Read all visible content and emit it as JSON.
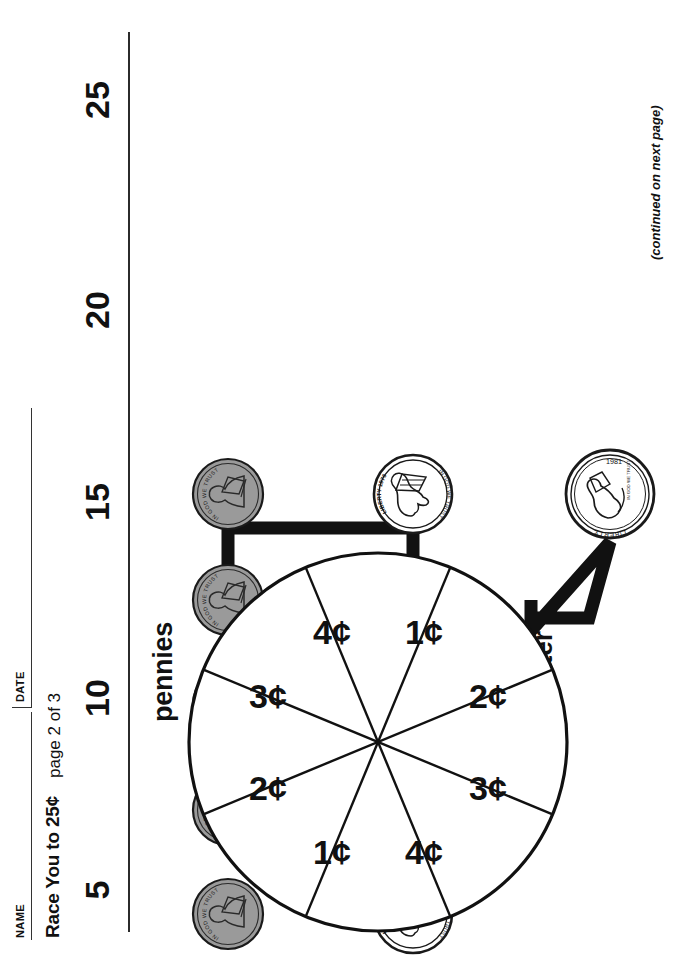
{
  "header": {
    "name_label": "NAME",
    "date_label": "DATE",
    "title": "Race You to 25¢",
    "page_note": "page 2 of 3"
  },
  "footer": {
    "note": "(continued on next page)"
  },
  "number_track": {
    "values": [
      "5",
      "10",
      "15",
      "20",
      "25"
    ],
    "x_positions": [
      40,
      232,
      428,
      620,
      830
    ]
  },
  "sections": {
    "pennies_label": "pennies",
    "nickels_label": "nickels",
    "quarter_label": "quarter"
  },
  "coins": {
    "pennies": {
      "count": 5,
      "denomination": "1¢",
      "inscriptions": [
        "IN GOD WE TRUST",
        "LIBERTY",
        "1976"
      ],
      "fill": "#9a9a9a",
      "stroke": "#1a1a1a",
      "radius": 35,
      "row_y": 58,
      "x_positions": [
        46,
        150,
        256,
        360,
        466
      ]
    },
    "nickels": {
      "count": 5,
      "denomination": "5¢",
      "inscriptions": [
        "LIBERTY 1976",
        "IN GOD WE TRUST"
      ],
      "fill": "#ffffff",
      "stroke": "#1a1a1a",
      "radius": 39,
      "row_y": 243,
      "x_positions": [
        46,
        150,
        256,
        360,
        466
      ]
    },
    "quarter": {
      "count": 1,
      "denomination": "25¢",
      "inscriptions": [
        "LIBERTY",
        "IN GOD WE TRUST",
        "1981"
      ],
      "fill": "#ffffff",
      "stroke": "#1a1a1a",
      "radius": 44,
      "center_x": 466,
      "center_y": 440
    }
  },
  "arrow": {
    "description": "thick bracket arrows joining pennies to nickels to quarter",
    "color": "#111111",
    "thickness": 13
  },
  "chart_data": {
    "type": "pie",
    "categories": [
      "3¢",
      "4¢",
      "1¢",
      "2¢",
      "3¢",
      "4¢",
      "1¢",
      "2¢"
    ],
    "values": [
      1,
      1,
      1,
      1,
      1,
      1,
      1,
      1
    ],
    "labels": [
      "3¢",
      "4¢",
      "1¢",
      "2¢",
      "3¢",
      "4¢",
      "1¢",
      "2¢"
    ],
    "slice_label_angles_deg": [
      -67.5,
      -22.5,
      22.5,
      67.5,
      112.5,
      157.5,
      202.5,
      247.5
    ],
    "legend": "none",
    "grid": false,
    "fill": "#ffffff",
    "stroke": "#111111"
  },
  "colors": {
    "ink": "#111111",
    "rule": "#333333",
    "penny_fill": "#9a9a9a",
    "paper": "#ffffff"
  }
}
